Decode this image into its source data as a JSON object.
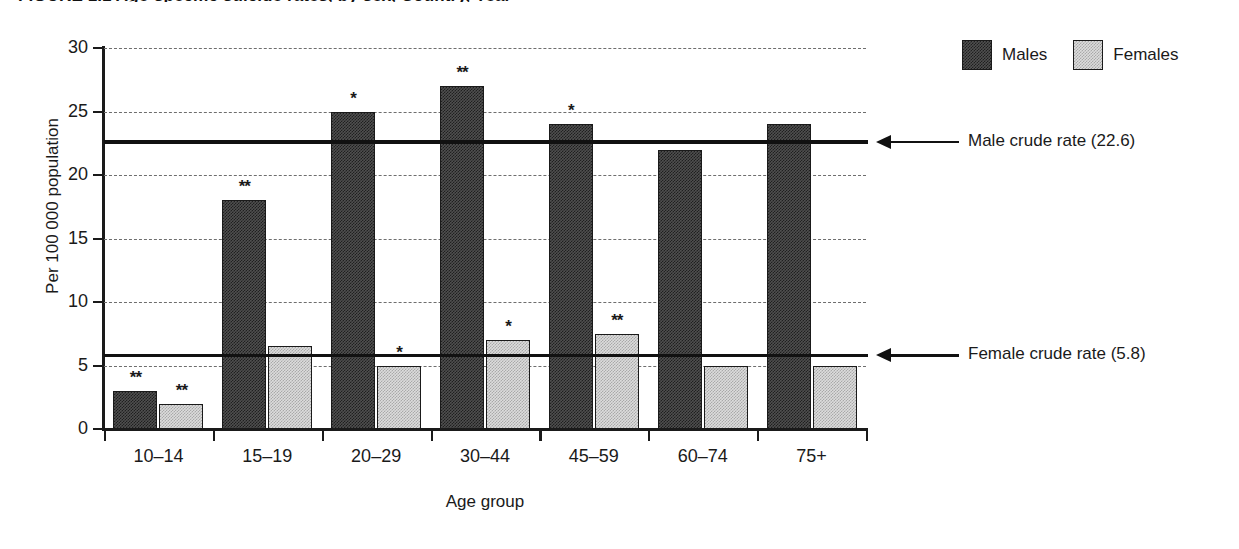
{
  "figure": {
    "title": "FIGURE 1.1  Age-specific suicide rates, by sex, Country, Year"
  },
  "legend": {
    "position": "top-right",
    "entries": [
      {
        "label": "Males",
        "color": "#4f4f4f",
        "pattern": "dense-dither"
      },
      {
        "label": "Females",
        "color": "#dcdcdc",
        "pattern": "sparse-dither"
      }
    ]
  },
  "annotations": [
    {
      "name": "male-crude-rate",
      "label": "Male crude rate (22.6)",
      "value": 22.6
    },
    {
      "name": "female-crude-rate",
      "label": "Female crude rate (5.8)",
      "value": 5.8
    }
  ],
  "chart_data": {
    "type": "bar",
    "title": "FIGURE 1.1  Age-specific suicide rates, by sex, Country, Year",
    "xlabel": "Age group",
    "ylabel": "Per 100 000 population",
    "ylim": [
      0,
      30
    ],
    "yticks": [
      0,
      5,
      10,
      15,
      20,
      25,
      30
    ],
    "grid": "horizontal-dashed",
    "legend_position": "top-right",
    "categories": [
      "10–14",
      "15–19",
      "20–29",
      "30–44",
      "45–59",
      "60–74",
      "75+"
    ],
    "series": [
      {
        "name": "Males",
        "color": "#4f4f4f",
        "values": [
          3,
          18,
          25,
          27,
          24,
          22,
          24
        ],
        "markers": [
          "**",
          "**",
          "*",
          "**",
          "*",
          "",
          ""
        ]
      },
      {
        "name": "Females",
        "color": "#dcdcdc",
        "values": [
          2,
          6.5,
          5,
          7,
          7.5,
          5,
          5
        ],
        "markers": [
          "**",
          "",
          "*",
          "*",
          "**",
          "",
          ""
        ]
      }
    ],
    "reference_lines": [
      {
        "name": "Male crude rate (22.6)",
        "value": 22.6
      },
      {
        "name": "Female crude rate (5.8)",
        "value": 5.8
      }
    ]
  }
}
